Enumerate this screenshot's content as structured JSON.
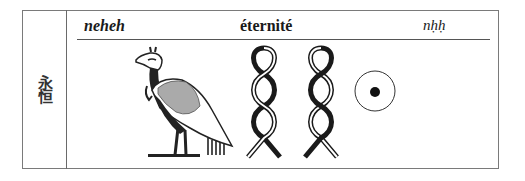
{
  "entry": {
    "chinese": "永恒",
    "transliteration": "neheh",
    "gloss": "éternité",
    "code": "nḥḥ"
  },
  "hieroglyphs": [
    {
      "name": "bird-glyph",
      "description": "ibis/bird"
    },
    {
      "name": "twisted-flax-glyph-1",
      "description": "twisted wick"
    },
    {
      "name": "twisted-flax-glyph-2",
      "description": "twisted wick"
    },
    {
      "name": "sun-disk-glyph",
      "description": "sun disk"
    }
  ]
}
